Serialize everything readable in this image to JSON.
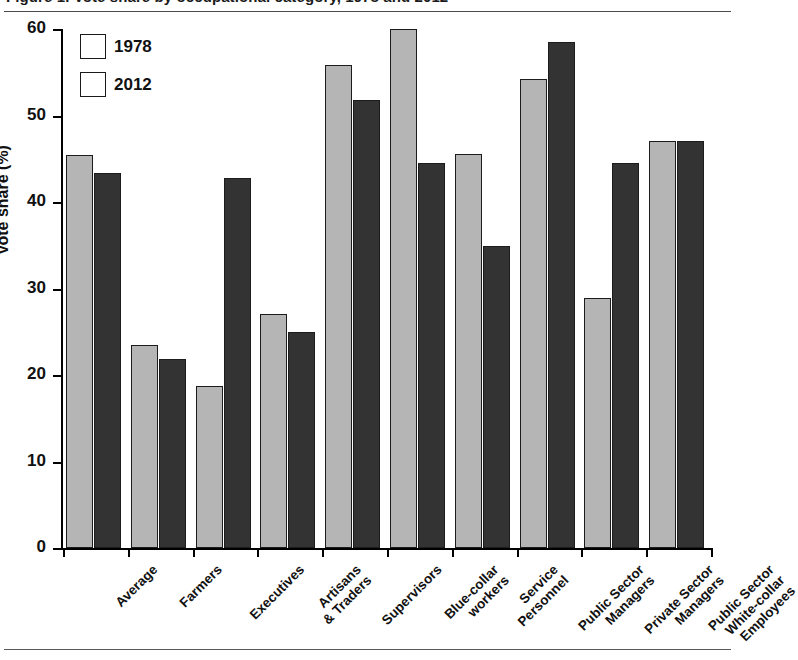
{
  "caption": {
    "text": "Figure 1. Vote share by occupational category, 1978 and 2012"
  },
  "chart_data": {
    "type": "bar",
    "title": "",
    "xlabel": "",
    "ylabel": "Vote share (%)",
    "ylim": [
      0,
      60
    ],
    "yticks": [
      0,
      10,
      20,
      30,
      40,
      50,
      60
    ],
    "ytick_labels": [
      "0",
      "10",
      "20",
      "30",
      "40",
      "50",
      "60"
    ],
    "grid": false,
    "legend_position": "top-left",
    "categories": [
      "Average",
      "Farmers",
      "Executives",
      "Artisans\n& Traders",
      "Supervisors",
      "Blue-collar\nworkers",
      "Service\nPersonnel",
      "Public Sector\nManagers",
      "Private Sector\nManagers",
      "Public Sector\nWhite-collar\nEmployees"
    ],
    "series": [
      {
        "name": "1978",
        "color": "#b5b5b5",
        "values": [
          45.4,
          23.5,
          18.7,
          27.1,
          55.8,
          60.0,
          45.5,
          54.2,
          28.9,
          47.0
        ]
      },
      {
        "name": "2012",
        "color": "#333333",
        "values": [
          43.4,
          21.8,
          42.8,
          25.0,
          51.8,
          44.5,
          34.9,
          58.5,
          44.5,
          47.1
        ]
      }
    ]
  }
}
